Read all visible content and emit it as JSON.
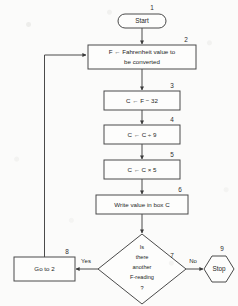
{
  "diagram": {
    "background_color": "#fbfbfa",
    "line_color": "#4a4a4a",
    "text_color": "#262626",
    "nodes": [
      {
        "id": "start",
        "step": "1",
        "shape": "terminator",
        "text": "Start"
      },
      {
        "id": "input-f",
        "step": "2",
        "shape": "process",
        "line1": "F ←  Fahrenheit value to",
        "line2": "be converted"
      },
      {
        "id": "subtract-32",
        "step": "3",
        "shape": "process",
        "text": "C ← F − 32"
      },
      {
        "id": "divide-9",
        "step": "4",
        "shape": "process",
        "text": "C ← C ÷ 9"
      },
      {
        "id": "multiply-5",
        "step": "5",
        "shape": "process",
        "text": "C ← C × 5"
      },
      {
        "id": "write-c",
        "step": "6",
        "shape": "process",
        "text": "Write value in box C"
      },
      {
        "id": "decision",
        "step": "7",
        "shape": "decision",
        "line1": "Is",
        "line2": "there",
        "line3": "another",
        "line4": "F-reading",
        "line5": "?"
      },
      {
        "id": "go-to-2",
        "step": "8",
        "shape": "process",
        "text": "Go to 2"
      },
      {
        "id": "stop",
        "step": "9",
        "shape": "hexagon",
        "text": "Stop"
      }
    ],
    "branch_labels": {
      "yes": "Yes",
      "no": "No"
    }
  }
}
